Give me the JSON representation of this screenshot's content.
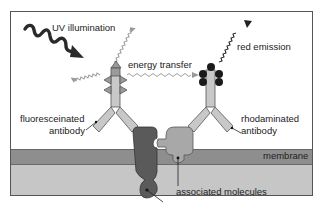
{
  "diagram": {
    "labels": {
      "uv_illumination": "UV illumination",
      "energy_transfer": "energy transfer",
      "red_emission": "red emission",
      "fluoresceinated_line1": "fluoresceinated",
      "fluoresceinated_line2": "antibody",
      "rhodaminated_line1": "rhodaminated",
      "rhodaminated_line2": "antibody",
      "membrane": "membrane",
      "associated_molecules": "associated molecules"
    },
    "colors": {
      "antibody": "#c8c8c8",
      "dark_molecule": "#5a5a5a",
      "light_molecule": "#a8a8a8",
      "membrane": "#8e8e8e",
      "cytoplasm": "#c6c6c6",
      "fluorophore_dots": "#1a1a1a"
    }
  }
}
